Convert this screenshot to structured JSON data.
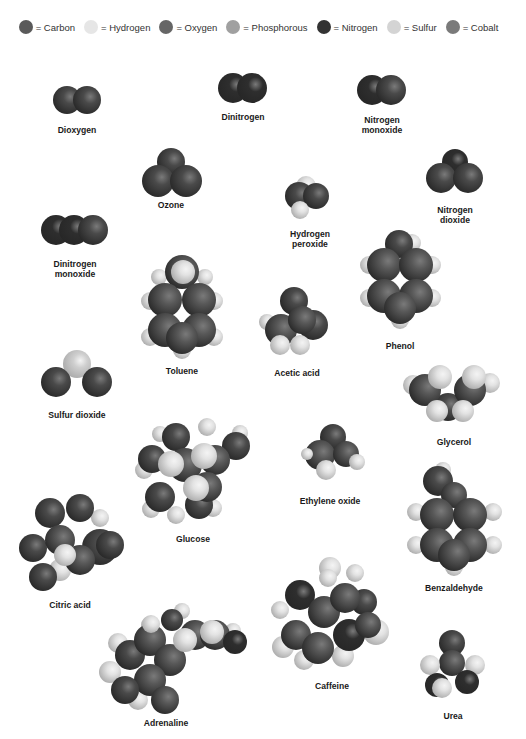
{
  "colors": {
    "carbon": "#585858",
    "hydrogen": "#e3e3e3",
    "oxygen": "#4a4a4a",
    "phosphorous": "#9c9c9c",
    "nitrogen": "#2e2e2e",
    "sulfur": "#cfcfcf",
    "cobalt": "#777777"
  },
  "legend": [
    {
      "key": "carbon",
      "label": "= Carbon",
      "color": "#5a5a5a"
    },
    {
      "key": "hydrogen",
      "label": "= Hydrogen",
      "color": "#e6e6e6"
    },
    {
      "key": "oxygen",
      "label": "= Oxygen",
      "color": "#666666"
    },
    {
      "key": "phosphorous",
      "label": "= Phosphorous",
      "color": "#a0a0a0"
    },
    {
      "key": "nitrogen",
      "label": "= Nitrogen",
      "color": "#333333"
    },
    {
      "key": "sulfur",
      "label": "= Sulfur",
      "color": "#d4d4d4"
    },
    {
      "key": "cobalt",
      "label": "= Cobalt",
      "color": "#7a7a7a"
    }
  ],
  "molecules": [
    {
      "name": "Dioxygen",
      "label": "Dioxygen",
      "label_x": 77,
      "label_y": 125,
      "atoms": [
        [
          67,
          100,
          14,
          "O"
        ],
        [
          87,
          100,
          14,
          "O"
        ]
      ]
    },
    {
      "name": "Dinitrogen",
      "label": "Dinitrogen",
      "label_x": 243,
      "label_y": 112,
      "atoms": [
        [
          233,
          88,
          15,
          "N"
        ],
        [
          252,
          88,
          15,
          "N"
        ]
      ]
    },
    {
      "name": "Nitrogen monoxide",
      "label": "Nitrogen\nmonoxide",
      "label_x": 382,
      "label_y": 115,
      "atoms": [
        [
          372,
          90,
          15,
          "N"
        ],
        [
          391,
          90,
          15,
          "O"
        ]
      ]
    },
    {
      "name": "Ozone",
      "label": "Ozone",
      "label_x": 171,
      "label_y": 200,
      "atoms": [
        [
          171,
          162,
          14,
          "O"
        ],
        [
          158,
          181,
          16,
          "O"
        ],
        [
          186,
          181,
          16,
          "O"
        ]
      ]
    },
    {
      "name": "Hydrogen peroxide",
      "label": "Hydrogen\nperoxide",
      "label_x": 310,
      "label_y": 229,
      "atoms": [
        [
          306,
          186,
          10,
          "H"
        ],
        [
          299,
          196,
          14,
          "O"
        ],
        [
          316,
          196,
          13,
          "O"
        ],
        [
          300,
          210,
          9,
          "H"
        ]
      ]
    },
    {
      "name": "Nitrogen dioxide",
      "label": "Nitrogen\ndioxide",
      "label_x": 455,
      "label_y": 205,
      "atoms": [
        [
          455,
          162,
          13,
          "N"
        ],
        [
          441,
          178,
          15,
          "O"
        ],
        [
          468,
          178,
          15,
          "O"
        ]
      ]
    },
    {
      "name": "Dinitrogen monoxide",
      "label": "Dinitrogen\nmonoxide",
      "label_x": 75,
      "label_y": 259,
      "atoms": [
        [
          56,
          230,
          15,
          "N"
        ],
        [
          74,
          230,
          15,
          "N"
        ],
        [
          93,
          230,
          15,
          "O"
        ]
      ]
    },
    {
      "name": "Toluene",
      "label": "Toluene",
      "label_x": 182,
      "label_y": 366,
      "atoms": [
        [
          159,
          277,
          8,
          "H"
        ],
        [
          205,
          277,
          8,
          "H"
        ],
        [
          150,
          301,
          9,
          "H"
        ],
        [
          214,
          301,
          9,
          "H"
        ],
        [
          150,
          337,
          9,
          "H"
        ],
        [
          214,
          337,
          9,
          "H"
        ],
        [
          182,
          350,
          9,
          "H"
        ],
        [
          182,
          272,
          17,
          "C"
        ],
        [
          165,
          300,
          17,
          "C"
        ],
        [
          199,
          300,
          17,
          "C"
        ],
        [
          165,
          330,
          17,
          "C"
        ],
        [
          199,
          330,
          17,
          "C"
        ],
        [
          182,
          338,
          16,
          "C"
        ],
        [
          183,
          272,
          12,
          "H"
        ]
      ]
    },
    {
      "name": "Acetic acid",
      "label": "Acetic acid",
      "label_x": 297,
      "label_y": 368,
      "atoms": [
        [
          267,
          322,
          8,
          "H"
        ],
        [
          294,
          301,
          14,
          "O"
        ],
        [
          313,
          325,
          15,
          "O"
        ],
        [
          281,
          330,
          16,
          "C"
        ],
        [
          302,
          320,
          14,
          "C"
        ],
        [
          280,
          345,
          10,
          "H"
        ],
        [
          300,
          345,
          10,
          "H"
        ]
      ]
    },
    {
      "name": "Phenol",
      "label": "Phenol",
      "label_x": 400,
      "label_y": 341,
      "atoms": [
        [
          412,
          243,
          9,
          "H"
        ],
        [
          369,
          265,
          9,
          "H"
        ],
        [
          432,
          265,
          9,
          "H"
        ],
        [
          369,
          298,
          9,
          "H"
        ],
        [
          432,
          298,
          9,
          "H"
        ],
        [
          400,
          320,
          9,
          "H"
        ],
        [
          399,
          244,
          14,
          "O"
        ],
        [
          384,
          265,
          17,
          "C"
        ],
        [
          416,
          265,
          17,
          "C"
        ],
        [
          384,
          296,
          17,
          "C"
        ],
        [
          416,
          296,
          17,
          "C"
        ],
        [
          400,
          308,
          16,
          "C"
        ]
      ]
    },
    {
      "name": "Sulfur dioxide",
      "label": "Sulfur dioxide",
      "label_x": 77,
      "label_y": 410,
      "atoms": [
        [
          77,
          364,
          14,
          "S"
        ],
        [
          56,
          382,
          15,
          "O"
        ],
        [
          97,
          382,
          15,
          "O"
        ]
      ]
    },
    {
      "name": "Glycerol",
      "label": "Glycerol",
      "label_x": 454,
      "label_y": 437,
      "atoms": [
        [
          413,
          385,
          10,
          "H"
        ],
        [
          490,
          383,
          10,
          "H"
        ],
        [
          448,
          407,
          14,
          "O"
        ],
        [
          425,
          390,
          16,
          "C"
        ],
        [
          470,
          390,
          16,
          "C"
        ],
        [
          440,
          377,
          12,
          "H"
        ],
        [
          474,
          377,
          12,
          "H"
        ],
        [
          437,
          411,
          11,
          "H"
        ],
        [
          463,
          411,
          11,
          "H"
        ]
      ]
    },
    {
      "name": "Glucose",
      "label": "Glucose",
      "label_x": 193,
      "label_y": 534,
      "atoms": [
        [
          160,
          434,
          8,
          "H"
        ],
        [
          207,
          427,
          9,
          "H"
        ],
        [
          240,
          433,
          8,
          "H"
        ],
        [
          144,
          470,
          9,
          "H"
        ],
        [
          151,
          509,
          9,
          "H"
        ],
        [
          176,
          515,
          9,
          "H"
        ],
        [
          213,
          508,
          9,
          "H"
        ],
        [
          176,
          437,
          14,
          "O"
        ],
        [
          236,
          446,
          14,
          "O"
        ],
        [
          152,
          459,
          14,
          "O"
        ],
        [
          160,
          497,
          15,
          "O"
        ],
        [
          199,
          505,
          14,
          "O"
        ],
        [
          185,
          465,
          17,
          "C"
        ],
        [
          215,
          460,
          15,
          "C"
        ],
        [
          207,
          487,
          15,
          "C"
        ],
        [
          171,
          464,
          13,
          "H"
        ],
        [
          204,
          456,
          13,
          "H"
        ],
        [
          196,
          488,
          13,
          "H"
        ]
      ]
    },
    {
      "name": "Ethylene oxide",
      "label": "Ethylene oxide",
      "label_x": 330,
      "label_y": 496,
      "atoms": [
        [
          333,
          437,
          13,
          "O"
        ],
        [
          320,
          455,
          15,
          "C"
        ],
        [
          346,
          454,
          13,
          "C"
        ],
        [
          326,
          470,
          10,
          "H"
        ],
        [
          357,
          462,
          8,
          "H"
        ],
        [
          307,
          454,
          6,
          "H"
        ]
      ]
    },
    {
      "name": "Citric acid",
      "label": "Citric acid",
      "label_x": 70,
      "label_y": 600,
      "atoms": [
        [
          30,
          545,
          9,
          "H"
        ],
        [
          100,
          518,
          9,
          "H"
        ],
        [
          60,
          570,
          11,
          "H"
        ],
        [
          33,
          548,
          14,
          "O"
        ],
        [
          50,
          513,
          15,
          "O"
        ],
        [
          80,
          508,
          14,
          "O"
        ],
        [
          43,
          577,
          14,
          "O"
        ],
        [
          100,
          547,
          18,
          "O"
        ],
        [
          110,
          545,
          14,
          "O"
        ],
        [
          60,
          540,
          15,
          "C"
        ],
        [
          80,
          560,
          15,
          "C"
        ],
        [
          65,
          555,
          11,
          "H"
        ]
      ]
    },
    {
      "name": "Benzaldehyde",
      "label": "Benzaldehyde",
      "label_x": 454,
      "label_y": 583,
      "atoms": [
        [
          443,
          470,
          8,
          "H"
        ],
        [
          416,
          512,
          9,
          "H"
        ],
        [
          493,
          512,
          9,
          "H"
        ],
        [
          416,
          545,
          9,
          "H"
        ],
        [
          493,
          545,
          9,
          "H"
        ],
        [
          454,
          567,
          9,
          "H"
        ],
        [
          438,
          481,
          15,
          "O"
        ],
        [
          454,
          495,
          13,
          "C"
        ],
        [
          437,
          515,
          17,
          "C"
        ],
        [
          470,
          515,
          17,
          "C"
        ],
        [
          437,
          545,
          17,
          "C"
        ],
        [
          470,
          545,
          17,
          "C"
        ],
        [
          454,
          555,
          16,
          "C"
        ]
      ]
    },
    {
      "name": "Caffeine",
      "label": "Caffeine",
      "label_x": 332,
      "label_y": 681,
      "atoms": [
        [
          330,
          568,
          11,
          "H"
        ],
        [
          355,
          573,
          9,
          "H"
        ],
        [
          280,
          610,
          9,
          "H"
        ],
        [
          283,
          647,
          11,
          "H"
        ],
        [
          376,
          632,
          13,
          "H"
        ],
        [
          304,
          660,
          10,
          "H"
        ],
        [
          343,
          656,
          11,
          "H"
        ],
        [
          364,
          602,
          13,
          "O"
        ],
        [
          300,
          595,
          15,
          "N"
        ],
        [
          296,
          635,
          15,
          "C"
        ],
        [
          324,
          612,
          16,
          "C"
        ],
        [
          345,
          598,
          15,
          "C"
        ],
        [
          318,
          648,
          16,
          "C"
        ],
        [
          349,
          635,
          16,
          "N"
        ],
        [
          368,
          625,
          13,
          "C"
        ],
        [
          328,
          578,
          9,
          "H"
        ]
      ]
    },
    {
      "name": "Adrenaline",
      "label": "Adrenaline",
      "label_x": 166,
      "label_y": 718,
      "atoms": [
        [
          150,
          625,
          9,
          "H"
        ],
        [
          118,
          643,
          10,
          "H"
        ],
        [
          110,
          672,
          11,
          "H"
        ],
        [
          138,
          700,
          10,
          "H"
        ],
        [
          182,
          611,
          8,
          "H"
        ],
        [
          233,
          631,
          8,
          "H"
        ],
        [
          130,
          655,
          15,
          "O"
        ],
        [
          150,
          640,
          16,
          "C"
        ],
        [
          170,
          660,
          16,
          "C"
        ],
        [
          150,
          680,
          16,
          "C"
        ],
        [
          125,
          690,
          14,
          "O"
        ],
        [
          165,
          700,
          14,
          "C"
        ],
        [
          172,
          620,
          11,
          "O"
        ],
        [
          195,
          635,
          15,
          "C"
        ],
        [
          215,
          635,
          15,
          "C"
        ],
        [
          235,
          642,
          12,
          "N"
        ],
        [
          185,
          640,
          12,
          "H"
        ],
        [
          212,
          632,
          12,
          "H"
        ],
        [
          151,
          624,
          9,
          "H"
        ]
      ]
    },
    {
      "name": "Urea",
      "label": "Urea",
      "label_x": 453,
      "label_y": 711,
      "atoms": [
        [
          452,
          643,
          13,
          "O"
        ],
        [
          452,
          663,
          13,
          "C"
        ],
        [
          430,
          665,
          10,
          "H"
        ],
        [
          475,
          665,
          10,
          "H"
        ],
        [
          437,
          685,
          12,
          "N"
        ],
        [
          467,
          682,
          12,
          "N"
        ],
        [
          442,
          688,
          10,
          "H"
        ]
      ]
    }
  ]
}
